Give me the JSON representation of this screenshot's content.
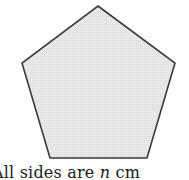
{
  "diagram": {
    "shape": "regular-pentagon",
    "fill_color": "#e6e6e6",
    "stroke_color": "#3a3a3a",
    "vertices": [
      [
        98,
        6
      ],
      [
        175,
        63
      ],
      [
        147,
        158
      ],
      [
        50,
        158
      ],
      [
        22,
        63
      ]
    ]
  },
  "caption": {
    "prefix": "All sides are ",
    "variable": "n",
    "suffix": " cm"
  }
}
